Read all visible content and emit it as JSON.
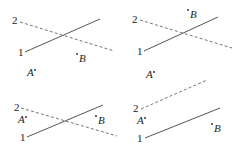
{
  "panels": [
    {
      "id": "panel-1",
      "line1": {
        "label": "1",
        "x1": 25,
        "y1": 52,
        "x2": 100,
        "y2": 19,
        "label_x": 18,
        "label_y": 56
      },
      "line2": {
        "label": "2",
        "x1": 20,
        "y1": 22,
        "x2": 114,
        "y2": 51,
        "label_x": 12,
        "label_y": 24
      },
      "point_a": {
        "label": "A",
        "x": 27,
        "y": 76,
        "dot_x": 35,
        "dot_y": 70
      },
      "point_b": {
        "label": "B",
        "x": 79,
        "y": 62,
        "dot_x": 77,
        "dot_y": 54
      }
    },
    {
      "id": "panel-2",
      "line1": {
        "label": "1",
        "x1": 144,
        "y1": 51,
        "x2": 218,
        "y2": 17,
        "label_x": 137,
        "label_y": 55
      },
      "line2": {
        "label": "2",
        "x1": 140,
        "y1": 20,
        "x2": 232,
        "y2": 48,
        "label_x": 132,
        "label_y": 23
      },
      "point_a": {
        "label": "A",
        "x": 146,
        "y": 78,
        "dot_x": 154,
        "dot_y": 72
      },
      "point_b": {
        "label": "B",
        "x": 190,
        "y": 18,
        "dot_x": 188,
        "dot_y": 10
      }
    },
    {
      "id": "panel-3",
      "line1": {
        "label": "1",
        "x1": 27,
        "y1": 137,
        "x2": 103,
        "y2": 105,
        "label_x": 20,
        "label_y": 141
      },
      "line2": {
        "label": "2",
        "x1": 21,
        "y1": 108,
        "x2": 117,
        "y2": 136,
        "label_x": 14,
        "label_y": 111
      },
      "point_a": {
        "label": "A",
        "x": 18,
        "y": 123,
        "dot_x": 26,
        "dot_y": 117
      },
      "point_b": {
        "label": "B",
        "x": 98,
        "y": 124,
        "dot_x": 96,
        "dot_y": 116
      }
    },
    {
      "id": "panel-4",
      "line1": {
        "label": "1",
        "x1": 145,
        "y1": 138,
        "x2": 220,
        "y2": 108,
        "label_x": 137,
        "label_y": 142
      },
      "line2": {
        "label": "2",
        "x1": 141,
        "y1": 109,
        "x2": 207,
        "y2": 80,
        "label_x": 133,
        "label_y": 112
      },
      "point_a": {
        "label": "A",
        "x": 137,
        "y": 124,
        "dot_x": 145,
        "dot_y": 118
      },
      "point_b": {
        "label": "B",
        "x": 214,
        "y": 132,
        "dot_x": 212,
        "dot_y": 124
      }
    }
  ],
  "legend": {
    "line1_style": "solid",
    "line2_style": "dashed"
  },
  "colors": {
    "solid_line": "#555555",
    "dashed_line": "#777777",
    "text": "#222222"
  }
}
